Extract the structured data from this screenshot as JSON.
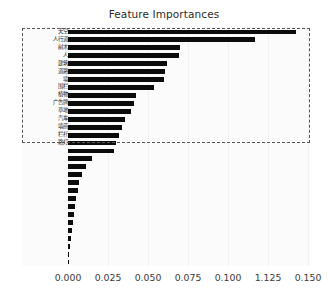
{
  "chart_data": {
    "type": "bar",
    "orientation": "horizontal",
    "title": "Feature Importances",
    "xlabel": "",
    "ylabel": "",
    "xlim": [
      0.0,
      0.1513
    ],
    "grid": false,
    "legend": null,
    "xticks": [
      "0.000",
      "0.025",
      "0.050",
      "0.075",
      "0.100",
      "1.125",
      "0.150"
    ],
    "xtick_values": [
      0.0,
      0.025,
      0.05,
      0.075,
      0.1,
      0.125,
      0.15
    ],
    "categories": [
      "天空",
      "人行道",
      "树木",
      "人",
      "建筑",
      "道路",
      "墙",
      "围栏",
      "植物",
      "广告牌",
      "草地",
      "汽车",
      "墙画",
      "栏杆",
      "路灯",
      "交通标志",
      "自行车",
      "卡车",
      "公交车",
      "骑行者",
      "地形",
      "电线杆",
      "交通灯",
      "摩托车",
      "轨道",
      "火车",
      "隧道",
      "护栏",
      "拖车",
      "其他"
    ],
    "values": [
      0.1425,
      0.117,
      0.07,
      0.0695,
      0.062,
      0.0605,
      0.06,
      0.0535,
      0.0425,
      0.0415,
      0.0395,
      0.0355,
      0.0335,
      0.032,
      0.03,
      0.029,
      0.015,
      0.011,
      0.0085,
      0.007,
      0.006,
      0.0052,
      0.0044,
      0.0038,
      0.003,
      0.0022,
      0.0016,
      0.0011,
      0.0007,
      0.0005
    ],
    "bar_color": "#0b0b0b",
    "labeled_rows": 15,
    "highlight_box": {
      "style": "dashed",
      "color": "#555555",
      "covers_rows": 15
    }
  }
}
